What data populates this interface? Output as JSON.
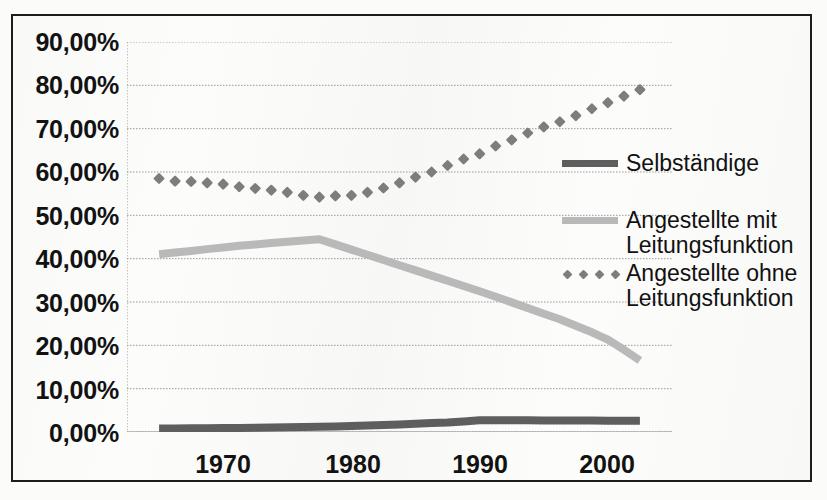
{
  "chart_data": {
    "type": "line",
    "title": "",
    "xlabel": "",
    "ylabel": "",
    "xlim": [
      1968,
      2002
    ],
    "ylim": [
      0,
      90
    ],
    "grid": true,
    "y_tick_labels": [
      "90,00%",
      "80,00%",
      "70,00%",
      "60,00%",
      "50,00%",
      "40,00%",
      "30,00%",
      "20,00%",
      "10,00%",
      "0,00%"
    ],
    "y_tick_values": [
      90,
      80,
      70,
      60,
      50,
      40,
      30,
      20,
      10,
      0
    ],
    "x_tick_labels": [
      "1970",
      "1980",
      "1990",
      "2000"
    ],
    "x_tick_values": [
      1970,
      1980,
      1990,
      2000
    ],
    "legend_position": "right",
    "series": [
      {
        "name": "Selbständige",
        "style": "solid-thick",
        "color": "#5e5e5e",
        "x": [
          1970,
          1971,
          1972,
          1973,
          1974,
          1975,
          1976,
          1977,
          1978,
          1979,
          1980,
          1981,
          1982,
          1983,
          1984,
          1985,
          1986,
          1987,
          1988,
          1989,
          1990,
          1991,
          1992,
          1993,
          1994,
          1995,
          1996,
          1997,
          1998,
          1999,
          2000
        ],
        "values": [
          0.8,
          0.82,
          0.85,
          0.88,
          0.9,
          0.95,
          1.0,
          1.05,
          1.1,
          1.15,
          1.2,
          1.3,
          1.4,
          1.5,
          1.6,
          1.75,
          1.9,
          2.05,
          2.2,
          2.45,
          2.7,
          2.72,
          2.72,
          2.7,
          2.68,
          2.66,
          2.64,
          2.62,
          2.6,
          2.6,
          2.6
        ]
      },
      {
        "name": "Angestellte mit Leitungsfunktion",
        "style": "solid-thick",
        "color": "#b9b9b9",
        "x": [
          1970,
          1971,
          1972,
          1973,
          1974,
          1975,
          1976,
          1977,
          1978,
          1979,
          1980,
          1981,
          1982,
          1983,
          1984,
          1985,
          1986,
          1987,
          1988,
          1989,
          1990,
          1991,
          1992,
          1993,
          1994,
          1995,
          1996,
          1997,
          1998,
          1999,
          2000
        ],
        "values": [
          41.0,
          41.4,
          41.8,
          42.2,
          42.6,
          43.0,
          43.3,
          43.6,
          43.9,
          44.2,
          44.5,
          43.3,
          42.1,
          40.9,
          39.7,
          38.5,
          37.3,
          36.1,
          34.9,
          33.7,
          32.5,
          31.2,
          29.9,
          28.6,
          27.3,
          26.0,
          24.5,
          23.0,
          21.3,
          19.0,
          16.5
        ]
      },
      {
        "name": "Angestellte ohne Leitungsfunktion",
        "style": "dotted-marker",
        "color": "#7d7d7d",
        "x": [
          1970,
          1971,
          1972,
          1973,
          1974,
          1975,
          1976,
          1977,
          1978,
          1979,
          1980,
          1981,
          1982,
          1983,
          1984,
          1985,
          1986,
          1987,
          1988,
          1989,
          1990,
          1991,
          1992,
          1993,
          1994,
          1995,
          1996,
          1997,
          1998,
          1999,
          2000
        ],
        "values": [
          58.5,
          57.9,
          57.8,
          57.5,
          57.2,
          56.6,
          56.2,
          55.8,
          55.3,
          54.6,
          54.2,
          54.5,
          54.6,
          55.3,
          56.3,
          57.5,
          58.8,
          60.0,
          61.5,
          63.0,
          64.2,
          66.0,
          67.4,
          69.0,
          70.4,
          71.6,
          73.0,
          74.6,
          76.0,
          77.5,
          79.0
        ]
      }
    ]
  },
  "legend": {
    "entries": [
      {
        "label_line1": "Selbständige",
        "label_line2": ""
      },
      {
        "label_line1": "Angestellte mit",
        "label_line2": "Leitungsfunktion"
      },
      {
        "label_line1": "Angestellte ohne",
        "label_line2": "Leitungsfunktion"
      }
    ]
  }
}
